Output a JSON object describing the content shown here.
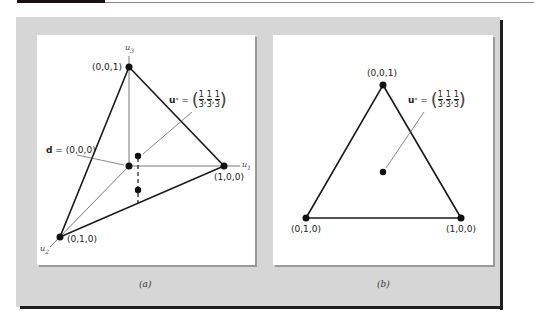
{
  "figure": {
    "panels": [
      {
        "id": "a",
        "caption": "(a)",
        "axes": {
          "u1": "u",
          "u1_sub": "1",
          "u2": "u",
          "u2_sub": "2",
          "u3": "u",
          "u3_sub": "3"
        },
        "vertices": {
          "top": "(0,0,1)",
          "right": "(1,0,0)",
          "left": "(0,1,0)"
        },
        "origin_label": {
          "bold": "d",
          "eq": " = (0,0,0)"
        },
        "ustar_label": {
          "bold": "u",
          "sup": "*",
          "eq": " = ",
          "num": "1",
          "den": "3"
        }
      },
      {
        "id": "b",
        "caption": "(b)",
        "vertices": {
          "top": "(0,0,1)",
          "right": "(1,0,0)",
          "left": "(0,1,0)"
        },
        "ustar_label": {
          "bold": "u",
          "sup": "*",
          "eq": " = ",
          "num": "1",
          "den": "3"
        }
      }
    ],
    "colors": {
      "frame": "#d6d6d6",
      "border": "#1e1e1e",
      "ink": "#111111"
    }
  }
}
